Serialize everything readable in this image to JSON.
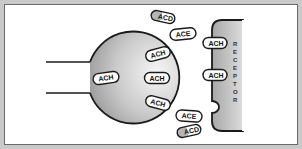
{
  "diagram": {
    "title": "",
    "colors": {
      "frame": "#c9c9c9",
      "outline": "#1a1a1a",
      "neuron_gradient_light": "#f4f4f4",
      "neuron_gradient_dark": "#9a9a9a",
      "receptor_light": "#d6d6d6",
      "receptor_dark": "#a8a8a8",
      "capsule_fill": "#ffffff",
      "acd_gray_end": "#b5b5b5"
    },
    "neuron": {
      "label": ""
    },
    "receptor": {
      "label": "RECEPTOR",
      "letters": [
        "R",
        "E",
        "C",
        "E",
        "P",
        "T",
        "O",
        "R"
      ]
    },
    "molecules": [
      {
        "id": "acd-top",
        "label": "ACD",
        "type": "ACD"
      },
      {
        "id": "ace-top",
        "label": "ACE",
        "type": "ACE"
      },
      {
        "id": "ach-release-1",
        "label": "ACH",
        "type": "ACH"
      },
      {
        "id": "ach-release-2",
        "label": "ACH",
        "type": "ACH"
      },
      {
        "id": "ach-release-3",
        "label": "ACH",
        "type": "ACH"
      },
      {
        "id": "ach-inside",
        "label": "ACH",
        "type": "ACH"
      },
      {
        "id": "ach-bound-1",
        "label": "ACH",
        "type": "ACH"
      },
      {
        "id": "ach-bound-2",
        "label": "ACH",
        "type": "ACH"
      },
      {
        "id": "ace-bottom",
        "label": "ACE",
        "type": "ACE"
      },
      {
        "id": "acd-bottom",
        "label": "ACD",
        "type": "ACD"
      }
    ]
  }
}
